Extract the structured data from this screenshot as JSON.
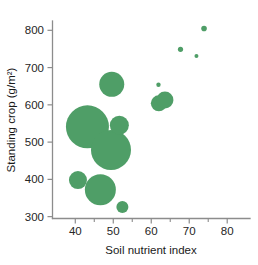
{
  "chart_data": {
    "type": "scatter",
    "subtype": "bubble",
    "title": "",
    "xlabel": "Soil nutrient index",
    "ylabel": "Standing crop (g/m²)",
    "xlim": [
      34,
      86
    ],
    "ylim": [
      295,
      825
    ],
    "xticks": [
      40,
      50,
      60,
      70,
      80
    ],
    "yticks": [
      300,
      400,
      500,
      600,
      700,
      800
    ],
    "xtick_labels": [
      "40",
      "50",
      "60",
      "70",
      "80"
    ],
    "ytick_labels": [
      "300",
      "400",
      "500",
      "600",
      "700",
      "800"
    ],
    "x_minor_tick_step": 5,
    "grid": false,
    "legend": null,
    "marker_color": "#4f9e67",
    "marker_shape": "circle",
    "size_encoding": "bubble area encodes a third variable",
    "points": [
      {
        "x": 40.7,
        "y": 398,
        "size": 9.0
      },
      {
        "x": 43.2,
        "y": 541,
        "size": 21.5
      },
      {
        "x": 46.6,
        "y": 372,
        "size": 15.5
      },
      {
        "x": 49.4,
        "y": 479,
        "size": 20.0
      },
      {
        "x": 49.6,
        "y": 655,
        "size": 12.5
      },
      {
        "x": 51.6,
        "y": 545,
        "size": 9.5
      },
      {
        "x": 52.4,
        "y": 326,
        "size": 6.0
      },
      {
        "x": 62.0,
        "y": 604,
        "size": 8.0
      },
      {
        "x": 61.9,
        "y": 654,
        "size": 2.2
      },
      {
        "x": 63.6,
        "y": 613,
        "size": 8.5
      },
      {
        "x": 67.7,
        "y": 749,
        "size": 2.6
      },
      {
        "x": 71.9,
        "y": 731,
        "size": 2.0
      },
      {
        "x": 73.9,
        "y": 805,
        "size": 2.8
      }
    ]
  }
}
